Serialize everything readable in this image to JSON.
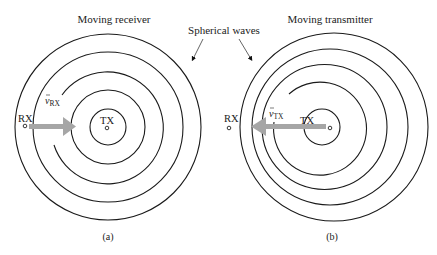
{
  "figure": {
    "annotation": "Spherical waves",
    "panels": [
      {
        "id": "a",
        "title": "Moving receiver",
        "caption": "(a)",
        "tx_label": "TX",
        "rx_label": "RX",
        "velocity_symbol": "v",
        "velocity_subscript": "RX",
        "moving_node": "RX",
        "motion_direction": "toward TX",
        "wavefront_count": 5,
        "wavefronts_concentric": true
      },
      {
        "id": "b",
        "title": "Moving transmitter",
        "caption": "(b)",
        "tx_label": "TX",
        "rx_label": "RX",
        "velocity_symbol": "v",
        "velocity_subscript": "TX",
        "moving_node": "TX",
        "motion_direction": "toward RX",
        "wavefront_count": 5,
        "wavefronts_concentric": false
      }
    ],
    "colors": {
      "lines": "#1a1a1a",
      "velocity_arrow": "#a6a6a6",
      "text": "#222222"
    }
  }
}
